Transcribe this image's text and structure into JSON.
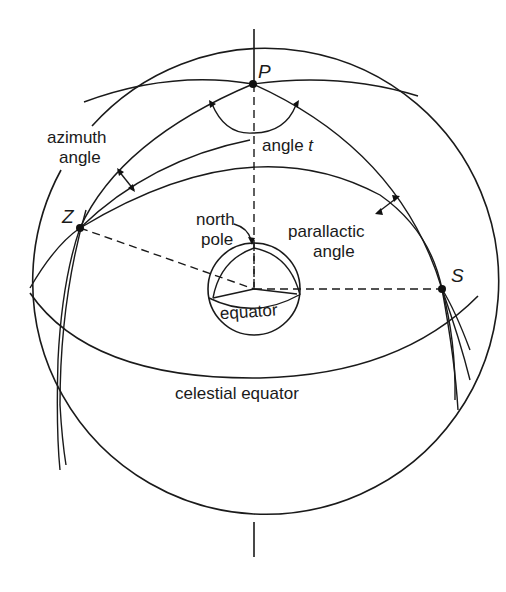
{
  "diagram": {
    "points": {
      "P": {
        "label": "P",
        "x": 253,
        "y": 84
      },
      "Z": {
        "label": "Z",
        "x": 80,
        "y": 228
      },
      "S": {
        "label": "S",
        "x": 442,
        "y": 289
      }
    },
    "labels": {
      "azimuth_line1": "azimuth",
      "azimuth_line2": "angle",
      "angle_t_prefix": "angle ",
      "angle_t_var": "t",
      "north_line1": "north",
      "north_line2": "pole",
      "parallactic_line1": "parallactic",
      "parallactic_line2": "angle",
      "small_equator": "equator",
      "celestial_equator": "celestial equator"
    },
    "geometry": {
      "outer_sphere": {
        "cx": 254,
        "cy": 289,
        "r": 233
      },
      "inner_sphere": {
        "cx": 254,
        "cy": 289,
        "r": 46
      }
    },
    "colors": {
      "line": "#1a1a1a",
      "background": "#ffffff"
    }
  }
}
